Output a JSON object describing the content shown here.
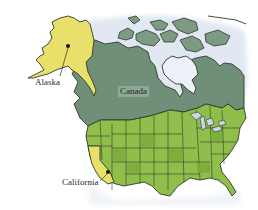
{
  "map": {
    "title": "",
    "labels": {
      "alaska": "Alaska",
      "canada": "Canada",
      "california": "California"
    },
    "regions": [
      {
        "name": "Alaska",
        "highlighted": true
      },
      {
        "name": "Canada",
        "highlighted": false
      },
      {
        "name": "Contiguous United States",
        "highlighted": false
      },
      {
        "name": "California",
        "highlighted": true
      }
    ],
    "markers": [
      {
        "label": "Alaska",
        "type": "dot"
      },
      {
        "label": "California",
        "type": "dot"
      }
    ],
    "colors": {
      "background": "#ffffff",
      "highlight_yellow": "#e8e06a",
      "canada_gray_green": "#6f8f78",
      "us_green": "#8fbf4a",
      "us_green_dark": "#79ad3c",
      "water_pale_blue": "#d9e2ef",
      "border_dark": "#2f3a2a"
    }
  }
}
